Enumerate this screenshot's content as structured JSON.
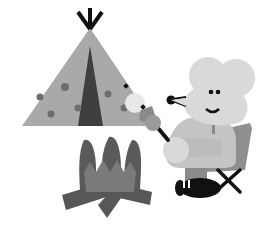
{
  "illustration": {
    "alt": "Grayscale illustration of a mouse in a folding camp chair roasting marshmallows over a campfire next to a teepee tent",
    "subjects": [
      "teepee-tent",
      "campfire",
      "mouse",
      "marshmallow-skewer",
      "camp-chair"
    ],
    "palette": {
      "background": "#ffffff",
      "tent": "#a9a9a9",
      "tent_door": "#3f3f3f",
      "tent_dots": "#6e6e6e",
      "tent_poles": "#111111",
      "fire_outer": "#5a5a5a",
      "fire_inner": "#7a7a7a",
      "logs": "#555555",
      "mouse_fur": "#d9d9d9",
      "mouse_body": "#c4c4c4",
      "chair_back": "#8f8f8f",
      "chair_legs": "#111111",
      "shoe": "#111111",
      "marshmallow": "#e8e8e8",
      "hand": "#8a8a8a",
      "features": "#111111"
    }
  }
}
